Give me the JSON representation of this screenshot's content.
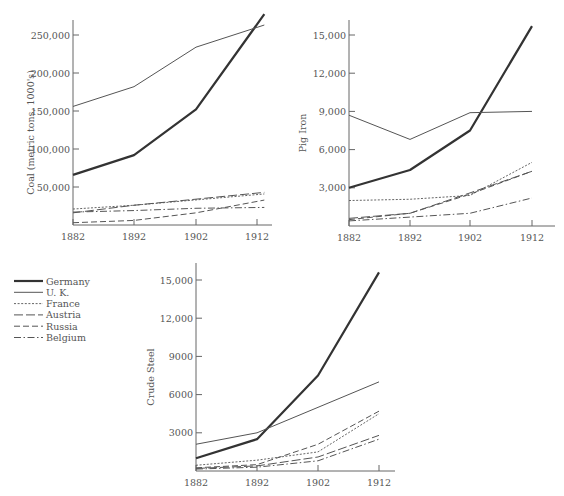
{
  "legend": {
    "items": [
      {
        "name": "Germany",
        "style": "thick-solid"
      },
      {
        "name": "U. K.",
        "style": "thin-solid"
      },
      {
        "name": "France",
        "style": "dotted"
      },
      {
        "name": "Austria",
        "style": "long-dash"
      },
      {
        "name": "Russia",
        "style": "dash"
      },
      {
        "name": "Belgium",
        "style": "dash-dot"
      }
    ]
  },
  "chart_data": [
    {
      "type": "line",
      "title": "",
      "xlabel": "",
      "ylabel": "Coal (metric tons, 1000's)",
      "categories": [
        "1882",
        "1892",
        "1902",
        "1912"
      ],
      "yticks": [
        "50,000",
        "100,000",
        "150,000",
        "200,000",
        "250,000"
      ],
      "ytick_values": [
        50000,
        100000,
        150000,
        200000,
        250000
      ],
      "ylim": [
        0,
        270000
      ],
      "grid": false,
      "series": [
        {
          "name": "Germany",
          "values": [
            66000,
            92000,
            152000,
            264000
          ]
        },
        {
          "name": "U. K.",
          "values": [
            156000,
            182000,
            234000,
            260000
          ]
        },
        {
          "name": "France",
          "values": [
            21000,
            26000,
            33000,
            40000
          ]
        },
        {
          "name": "Austria",
          "values": [
            16000,
            26000,
            34000,
            42000
          ]
        },
        {
          "name": "Russia",
          "values": [
            3000,
            6000,
            16000,
            31000
          ]
        },
        {
          "name": "Belgium",
          "values": [
            17000,
            19000,
            22000,
            23000
          ]
        }
      ]
    },
    {
      "type": "line",
      "title": "",
      "xlabel": "",
      "ylabel": "Pig Iron",
      "categories": [
        "1882",
        "1892",
        "1902",
        "1912"
      ],
      "yticks": [
        "3,000",
        "6,000",
        "9,000",
        "12,000",
        "15,000"
      ],
      "ytick_values": [
        3000,
        6000,
        9000,
        12000,
        15000
      ],
      "ylim": [
        0,
        16000
      ],
      "grid": false,
      "series": [
        {
          "name": "Germany",
          "values": [
            3000,
            4400,
            7500,
            15700
          ]
        },
        {
          "name": "U. K.",
          "values": [
            8700,
            6800,
            8900,
            9000
          ]
        },
        {
          "name": "France",
          "values": [
            2000,
            2100,
            2400,
            5000
          ]
        },
        {
          "name": "Austria",
          "values": [
            600,
            1000,
            2600,
            4300
          ]
        },
        {
          "name": "Russia",
          "values": [
            500,
            1000,
            2500,
            4300
          ]
        },
        {
          "name": "Belgium",
          "values": [
            400,
            700,
            1000,
            2200
          ]
        }
      ]
    },
    {
      "type": "line",
      "title": "",
      "xlabel": "",
      "ylabel": "Crude Steel",
      "categories": [
        "1882",
        "1892",
        "1902",
        "1912"
      ],
      "yticks": [
        "3000",
        "6000",
        "9000",
        "12,000",
        "15,000"
      ],
      "ytick_values": [
        3000,
        6000,
        9000,
        12000,
        15000
      ],
      "ylim": [
        0,
        16000
      ],
      "grid": false,
      "series": [
        {
          "name": "Germany",
          "values": [
            1000,
            2500,
            7500,
            15600
          ]
        },
        {
          "name": "U. K.",
          "values": [
            2100,
            3000,
            5000,
            7000
          ]
        },
        {
          "name": "France",
          "values": [
            450,
            850,
            1500,
            4500
          ]
        },
        {
          "name": "Austria",
          "values": [
            200,
            400,
            1100,
            2800
          ]
        },
        {
          "name": "Russia",
          "values": [
            250,
            500,
            2100,
            4700
          ]
        },
        {
          "name": "Belgium",
          "values": [
            150,
            300,
            800,
            2500
          ]
        }
      ]
    }
  ]
}
